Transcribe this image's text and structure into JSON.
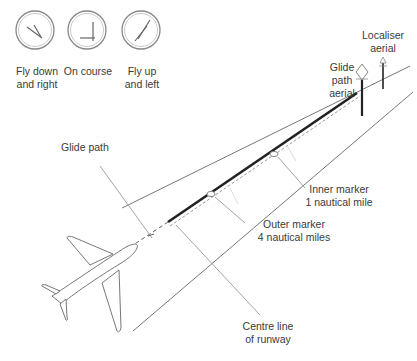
{
  "diagram": {
    "indicators": [
      {
        "id": "fly-down-right",
        "label_line1": "Fly down",
        "label_line2": "and right"
      },
      {
        "id": "on-course",
        "label_line1": "On course",
        "label_line2": ""
      },
      {
        "id": "fly-up-left",
        "label_line1": "Fly up",
        "label_line2": "and left"
      }
    ],
    "labels": {
      "localiser_line1": "Localiser",
      "localiser_line2": "aerial",
      "glide_aerial_line1": "Glide",
      "glide_aerial_line2": "path",
      "glide_aerial_line3": "aerial",
      "glide_path": "Glide path",
      "inner_marker_line1": "Inner marker",
      "inner_marker_line2": "1 nautical mile",
      "outer_marker_line1": "Outer marker",
      "outer_marker_line2": "4 nautical miles",
      "centre_line_line1": "Centre line",
      "centre_line_line2": "of runway"
    },
    "colors": {
      "line": "#6b6b6b",
      "runway": "#222222",
      "text": "#3a3a3a"
    }
  }
}
